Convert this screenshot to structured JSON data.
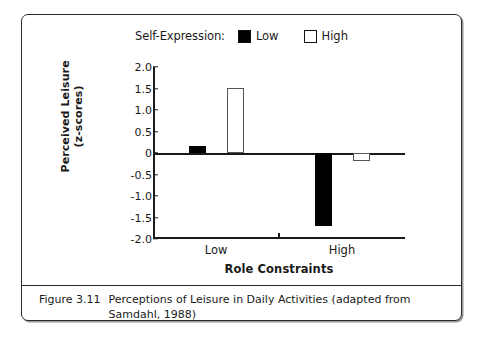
{
  "figure": {
    "caption_number": "Figure 3.11",
    "caption_text": "Perceptions of Leisure in Daily Activities (adapted from Samdahl, 1988)"
  },
  "legend": {
    "title": "Self-Expression:",
    "entries": [
      {
        "label": "Low",
        "swatch": "filled-square-icon",
        "color": "#000000"
      },
      {
        "label": "High",
        "swatch": "hollow-square-icon",
        "color": "#ffffff"
      }
    ]
  },
  "chart_data": {
    "type": "bar",
    "title": "",
    "xlabel": "Role Constraints",
    "ylabel": "Perceived Leisure\n(z-scores)",
    "ylabel_line1": "Perceived Leisure",
    "ylabel_line2": "(z-scores)",
    "categories": [
      "Low",
      "High"
    ],
    "series": [
      {
        "name": "Low",
        "values": [
          0.17,
          -1.7
        ]
      },
      {
        "name": "High",
        "values": [
          1.52,
          -0.18
        ]
      }
    ],
    "ylim": [
      -2.0,
      2.0
    ],
    "yticks": [
      "2.0",
      "1.5",
      "1.0",
      "0.5",
      "0",
      "-0.5",
      "-1.0",
      "-1.5",
      "-2.0"
    ],
    "ytick_values": [
      2.0,
      1.5,
      1.0,
      0.5,
      0,
      -0.5,
      -1.0,
      -1.5,
      -2.0
    ],
    "grid": false,
    "legend_position": "top-center"
  }
}
